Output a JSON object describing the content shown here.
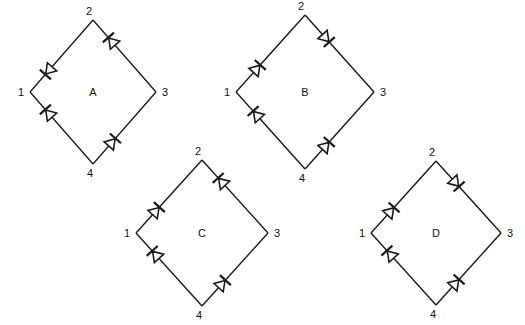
{
  "diagram": {
    "background_color": "#ffffff",
    "line_color": "#1a1a1a",
    "text_color": "#111111",
    "node_labels": [
      "1",
      "2",
      "3",
      "4"
    ],
    "figures": [
      {
        "id": "A",
        "label": "A",
        "center": {
          "x": 93,
          "y": 92
        },
        "radius": {
          "x": 63,
          "y": 72
        },
        "nodes": {
          "top": "2",
          "left": "1",
          "right": "3",
          "bottom": "4"
        },
        "diodes": [
          {
            "edge": "left-top",
            "from": "1",
            "to": "2",
            "conducts": "2-to-1",
            "arrow_direction": "toward-1"
          },
          {
            "edge": "top-right",
            "from": "2",
            "to": "3",
            "conducts": "3-to-2",
            "arrow_direction": "toward-2"
          },
          {
            "edge": "left-bottom",
            "from": "1",
            "to": "4",
            "conducts": "4-to-1",
            "arrow_direction": "toward-1"
          },
          {
            "edge": "bottom-right",
            "from": "4",
            "to": "3",
            "conducts": "4-to-3",
            "arrow_direction": "toward-3"
          }
        ]
      },
      {
        "id": "B",
        "label": "B",
        "center": {
          "x": 305,
          "y": 92
        },
        "radius": {
          "x": 69,
          "y": 77
        },
        "nodes": {
          "top": "2",
          "left": "1",
          "right": "3",
          "bottom": "4"
        },
        "diodes": [
          {
            "edge": "left-top",
            "from": "1",
            "to": "2",
            "conducts": "1-to-2",
            "arrow_direction": "toward-2"
          },
          {
            "edge": "top-right",
            "from": "2",
            "to": "3",
            "conducts": "2-to-3",
            "arrow_direction": "toward-3"
          },
          {
            "edge": "left-bottom",
            "from": "1",
            "to": "4",
            "conducts": "4-to-1",
            "arrow_direction": "toward-1"
          },
          {
            "edge": "bottom-right",
            "from": "4",
            "to": "3",
            "conducts": "4-to-3",
            "arrow_direction": "toward-3"
          }
        ]
      },
      {
        "id": "C",
        "label": "C",
        "center": {
          "x": 202,
          "y": 233
        },
        "radius": {
          "x": 66,
          "y": 73
        },
        "nodes": {
          "top": "2",
          "left": "1",
          "right": "3",
          "bottom": "4"
        },
        "diodes": [
          {
            "edge": "left-top",
            "from": "1",
            "to": "2",
            "conducts": "1-to-2",
            "arrow_direction": "toward-2"
          },
          {
            "edge": "top-right",
            "from": "2",
            "to": "3",
            "conducts": "3-to-2",
            "arrow_direction": "toward-2"
          },
          {
            "edge": "left-bottom",
            "from": "1",
            "to": "4",
            "conducts": "4-to-1",
            "arrow_direction": "toward-1"
          },
          {
            "edge": "bottom-right",
            "from": "4",
            "to": "3",
            "conducts": "4-to-3",
            "arrow_direction": "toward-3"
          }
        ]
      },
      {
        "id": "D",
        "label": "D",
        "center": {
          "x": 436,
          "y": 233
        },
        "radius": {
          "x": 65,
          "y": 72
        },
        "nodes": {
          "top": "2",
          "left": "1",
          "right": "3",
          "bottom": "4"
        },
        "diodes": [
          {
            "edge": "left-top",
            "from": "1",
            "to": "2",
            "conducts": "1-to-2",
            "arrow_direction": "toward-2"
          },
          {
            "edge": "top-right",
            "from": "2",
            "to": "3",
            "conducts": "2-to-3",
            "arrow_direction": "toward-3"
          },
          {
            "edge": "left-bottom",
            "from": "1",
            "to": "4",
            "conducts": "4-to-1",
            "arrow_direction": "toward-1"
          },
          {
            "edge": "bottom-right",
            "from": "4",
            "to": "3",
            "conducts": "4-to-3",
            "arrow_direction": "toward-3"
          }
        ]
      }
    ]
  }
}
